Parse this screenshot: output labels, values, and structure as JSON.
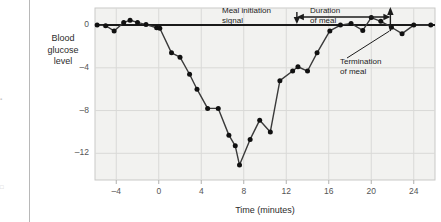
{
  "chart_data": {
    "type": "line",
    "title": "",
    "subtitle": "",
    "xlabel": "Time (minutes)",
    "ylabel": "Blood glucose level",
    "ylabel_lines": [
      "Blood",
      "glucose",
      "level"
    ],
    "xlim": [
      -6,
      26
    ],
    "ylim": [
      -14.5,
      1.6
    ],
    "xticks": [
      -4,
      0,
      4,
      8,
      12,
      16,
      20,
      24
    ],
    "xtick_labels": [
      "–4",
      "0",
      "4",
      "8",
      "12",
      "16",
      "20",
      "24"
    ],
    "yticks": [
      0,
      -4,
      -8,
      -12
    ],
    "ytick_labels": [
      "0",
      "–4",
      "–8",
      "–12"
    ],
    "grid": true,
    "legend": "none",
    "series": [
      {
        "name": "Blood glucose level",
        "marker": "filled-circle",
        "color": "#1a1a1a",
        "points": [
          [
            -5.8,
            0.0
          ],
          [
            -5.0,
            -0.05
          ],
          [
            -4.2,
            -0.55
          ],
          [
            -3.3,
            0.25
          ],
          [
            -2.7,
            0.45
          ],
          [
            -2.0,
            0.25
          ],
          [
            -1.2,
            0.05
          ],
          [
            -0.2,
            -0.25
          ],
          [
            0.1,
            -0.3
          ],
          [
            1.2,
            -2.6
          ],
          [
            2.0,
            -3.0
          ],
          [
            2.9,
            -4.6
          ],
          [
            3.6,
            -6.0
          ],
          [
            4.6,
            -7.8
          ],
          [
            5.6,
            -7.8
          ],
          [
            6.6,
            -10.3
          ],
          [
            7.2,
            -11.3
          ],
          [
            7.6,
            -13.1
          ],
          [
            8.6,
            -10.7
          ],
          [
            9.5,
            -8.9
          ],
          [
            10.5,
            -10.0
          ],
          [
            11.4,
            -5.2
          ],
          [
            12.6,
            -4.3
          ],
          [
            13.1,
            -3.9
          ],
          [
            14.0,
            -4.3
          ],
          [
            14.9,
            -2.6
          ],
          [
            16.1,
            -0.55
          ],
          [
            17.1,
            0.0
          ],
          [
            18.1,
            0.15
          ],
          [
            19.2,
            -0.5
          ],
          [
            20.0,
            0.7
          ],
          [
            20.9,
            0.35
          ],
          [
            21.9,
            -0.2
          ],
          [
            22.9,
            -0.8
          ],
          [
            24.0,
            0.0
          ],
          [
            25.6,
            0.0
          ]
        ]
      }
    ],
    "baseline": {
      "y": 0,
      "label": "zero baseline"
    },
    "annotations": [
      {
        "name": "meal-initiation-signal",
        "text": "Meal initiation signal",
        "lines": [
          "Meal initiation",
          "signal"
        ],
        "marker": "down-arrow",
        "x": 13.0
      },
      {
        "name": "duration-of-meal",
        "text": "Duration of meal",
        "lines": [
          "Duration",
          "of meal"
        ],
        "marker": "double-ended-span",
        "x_start": 13.0,
        "x_end": 21.8
      },
      {
        "name": "termination-of-meal",
        "text": "Termination of meal",
        "lines": [
          "Termination",
          "of meal"
        ],
        "marker": "up-arrow",
        "x": 21.8
      }
    ]
  },
  "margin_fragments": {
    "upper": "▪",
    "lower": "□"
  },
  "colors": {
    "plot_background": "#f2f2f0",
    "plot_border": "#c9c9c7",
    "gridline": "#d9d9d7",
    "data_line": "#3a3a3a",
    "marker": "#111111",
    "baseline": "#1a1a1a",
    "tick_text": "#555555",
    "label_text": "#2b2b2b",
    "annotation_text": "#1c1c1c",
    "page_rule": "#b8b8b8"
  }
}
